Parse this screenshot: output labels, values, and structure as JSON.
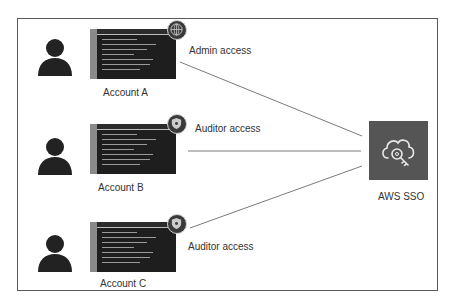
{
  "diagram": {
    "accounts": [
      {
        "label": "Account A",
        "access_label": "Admin access",
        "badge_icon": "globe-icon"
      },
      {
        "label": "Account B",
        "access_label": "Auditor access",
        "badge_icon": "shield-badge-icon"
      },
      {
        "label": "Account C",
        "access_label": "Auditor access",
        "badge_icon": "shield-badge-icon"
      }
    ],
    "target": {
      "label": "AWS SSO",
      "icon": "cloud-key-icon"
    },
    "colors": {
      "frame": "#5a5a5a",
      "screen": "#1e1e1e",
      "sso_box": "#555555",
      "person": "#222222",
      "connector": "#7a7a7a"
    }
  }
}
